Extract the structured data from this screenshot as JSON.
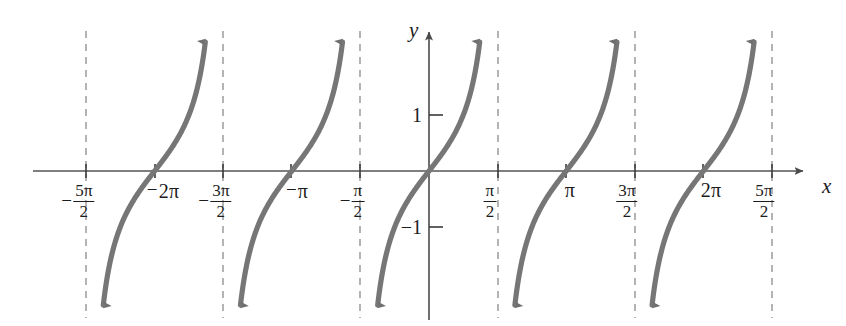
{
  "chart_data": {
    "type": "line",
    "title": "",
    "subtitle": "",
    "function": "y = tan x",
    "xlabel": "x",
    "ylabel": "y",
    "grid": false,
    "legend": null,
    "xlim": [
      -8.64,
      8.64
    ],
    "ylim": [
      -2.55,
      2.55
    ],
    "x_unit": "pi/2",
    "x_tick_values": [
      -7.854,
      -6.283,
      -4.712,
      -3.1416,
      -1.5708,
      1.5708,
      3.1416,
      4.712,
      6.283,
      7.854
    ],
    "x_tick_labels": [
      "-5pi/2",
      "-2pi",
      "-3pi/2",
      "-pi",
      "-pi/2",
      "pi/2",
      "pi",
      "3pi/2",
      "2pi",
      "5pi/2"
    ],
    "y_tick_values": [
      1,
      -1
    ],
    "y_tick_labels": [
      "1",
      "-1"
    ],
    "asymptotes": [
      -7.854,
      -4.712,
      -1.5708,
      1.5708,
      4.712,
      7.854
    ],
    "asymptote_style": "dashed",
    "branches": [
      {
        "center": -6.283,
        "domain": [
          -7.854,
          -4.712
        ]
      },
      {
        "center": -3.1416,
        "domain": [
          -4.712,
          -1.5708
        ]
      },
      {
        "center": 0.0,
        "domain": [
          -1.5708,
          1.5708
        ]
      },
      {
        "center": 3.1416,
        "domain": [
          1.5708,
          4.712
        ]
      },
      {
        "center": 6.283,
        "domain": [
          4.712,
          7.854
        ]
      }
    ],
    "zero_crossings": [
      -6.283,
      -3.1416,
      0,
      3.1416,
      6.283
    ],
    "curve_color": "#767676",
    "axis_color": "#555555",
    "asymptote_color": "#8c8c8c",
    "background_color": "#ffffff"
  },
  "axes": {
    "x_axis_label": "x",
    "y_axis_label": "y",
    "x_arrow": "arrow-right",
    "y_arrow": "arrow-up"
  },
  "x_ticks": [
    {
      "id": "neg-5pi-over-2",
      "sign": "−",
      "kind": "fraction",
      "numerator": "5π",
      "denominator": "2",
      "px": 86
    },
    {
      "id": "neg-2pi",
      "sign": "−",
      "kind": "plain",
      "text": "2π",
      "px": 155
    },
    {
      "id": "neg-3pi-over-2",
      "sign": "−",
      "kind": "fraction",
      "numerator": "3π",
      "denominator": "2",
      "px": 223
    },
    {
      "id": "neg-pi",
      "sign": "−",
      "kind": "plain",
      "text": "π",
      "px": 291
    },
    {
      "id": "neg-pi-over-2",
      "sign": "−",
      "kind": "fraction",
      "numerator": "π",
      "denominator": "2",
      "px": 360
    },
    {
      "id": "pi-over-2",
      "sign": "",
      "kind": "fraction",
      "numerator": "π",
      "denominator": "2",
      "px": 498
    },
    {
      "id": "pi",
      "sign": "",
      "kind": "plain",
      "text": "π",
      "px": 566
    },
    {
      "id": "three-pi-over-2",
      "sign": "",
      "kind": "fraction",
      "numerator": "3π",
      "denominator": "2",
      "px": 635
    },
    {
      "id": "two-pi",
      "sign": "",
      "kind": "plain",
      "text": "2π",
      "px": 703
    },
    {
      "id": "five-pi-over-2",
      "sign": "",
      "kind": "fraction",
      "numerator": "5π",
      "denominator": "2",
      "px": 772
    }
  ],
  "y_ticks": [
    {
      "id": "y-one",
      "text": "1",
      "px": 115
    },
    {
      "id": "y-neg-one",
      "text": "−1",
      "px": 227
    }
  ]
}
